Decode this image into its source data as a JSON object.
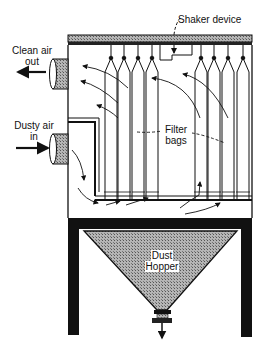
{
  "diagram": {
    "labels": {
      "shaker_device": "Shaker device",
      "clean_air_line1": "Clean air",
      "clean_air_line2": "out",
      "dusty_air_line1": "Dusty air",
      "dusty_air_line2": "in",
      "filter_bags_line1": "Filter",
      "filter_bags_line2": "bags",
      "dust_hopper_line1": "Dust",
      "dust_hopper_line2": "Hopper"
    },
    "components": [
      "top-beam",
      "shaker-device",
      "clean-air-outlet-pipe",
      "dusty-air-inlet-pipe",
      "filter-bags",
      "tube-sheet",
      "dust-hopper",
      "support-legs",
      "discharge-valve"
    ],
    "filter_bag_count": 8,
    "colors": {
      "line": "#111111",
      "hatch": "#8a8a8a",
      "background": "#ffffff"
    }
  }
}
